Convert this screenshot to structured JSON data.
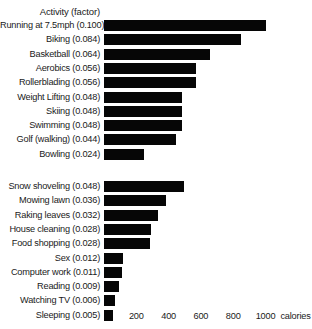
{
  "chart_data": {
    "type": "bar",
    "orientation": "horizontal",
    "title": "Activity (factor)",
    "xlabel": "calories",
    "ylabel": "Activity (factor)",
    "xlim": [
      0,
      1100
    ],
    "grid": false,
    "legend": null,
    "axis_unit_label": "calories",
    "xticks": [
      200,
      400,
      600,
      800,
      1000
    ],
    "xtick_labels": [
      "200",
      "400",
      "600",
      "800",
      "1000"
    ],
    "groups": [
      {
        "name": "exercise",
        "categories": [
          "Running at 7.5mph (0.100)",
          "Biking (0.084)",
          "Basketball (0.064)",
          "Aerobics (0.056)",
          "Rollerblading (0.056)",
          "Weight Lifting (0.048)",
          "Skiing (0.048)",
          "Swimming (0.048)",
          "Golf (walking) (0.044)",
          "Bowling (0.024)"
        ],
        "factors": [
          0.1,
          0.084,
          0.064,
          0.056,
          0.056,
          0.048,
          0.048,
          0.048,
          0.044,
          0.024
        ],
        "values": [
          1005,
          850,
          655,
          570,
          570,
          485,
          485,
          485,
          445,
          245
        ]
      },
      {
        "name": "daily-activity",
        "categories": [
          "Snow shoveling (0.048)",
          "Mowing lawn (0.036)",
          "Raking leaves (0.032)",
          "House cleaning (0.028)",
          "Food shopping (0.028)",
          "Sex (0.012)",
          "Computer work (0.011)",
          "Reading (0.009)",
          "Watching TV (0.006)",
          "Sleeping (0.005)"
        ],
        "factors": [
          0.048,
          0.036,
          0.032,
          0.028,
          0.028,
          0.012,
          0.011,
          0.009,
          0.006,
          0.005
        ],
        "values": [
          495,
          385,
          335,
          290,
          285,
          120,
          110,
          95,
          70,
          55
        ]
      }
    ],
    "colors": {
      "bar": "#060606",
      "background": "#ffffff",
      "text": "#1a1a1a"
    },
    "layout": {
      "bar_origin_x": 104,
      "px_per_100_cal": 16.15,
      "row_pitch": 14.3,
      "bar_height": 11,
      "group_gap": 18,
      "first_row_top": 20,
      "axis_top": 310
    }
  }
}
